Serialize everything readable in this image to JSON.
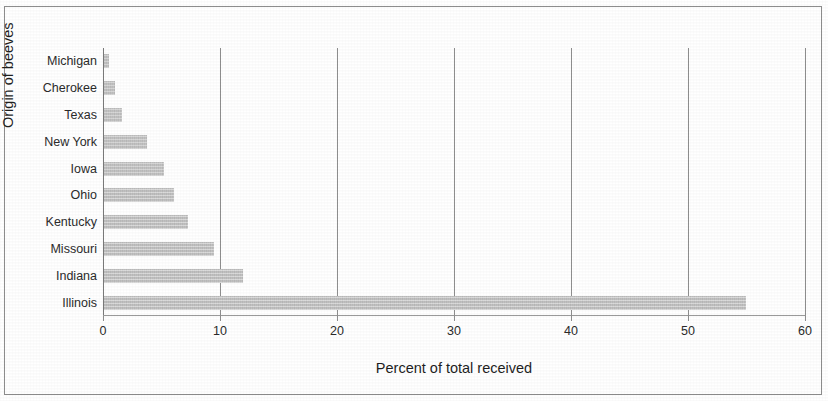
{
  "chart_data": {
    "type": "bar",
    "orientation": "horizontal",
    "title": "",
    "xlabel": "Percent of total received",
    "ylabel": "Origin of beeves",
    "categories": [
      "Illinois",
      "Indiana",
      "Missouri",
      "Kentucky",
      "Ohio",
      "Iowa",
      "New York",
      "Texas",
      "Cherokee",
      "Michigan"
    ],
    "values": [
      54.9,
      11.9,
      9.4,
      7.2,
      6.0,
      5.1,
      3.7,
      1.5,
      0.9,
      0.4
    ],
    "series": [
      {
        "name": "Percent of total received",
        "values": [
          54.9,
          11.9,
          9.4,
          7.2,
          6.0,
          5.1,
          3.7,
          1.5,
          0.9,
          0.4
        ]
      }
    ],
    "display_order_top_to_bottom": [
      "Michigan",
      "Cherokee",
      "Texas",
      "New York",
      "Iowa",
      "Ohio",
      "Kentucky",
      "Missouri",
      "Indiana",
      "Illinois"
    ],
    "xlim": [
      0,
      60
    ],
    "xticks": [
      0,
      10,
      20,
      30,
      40,
      50,
      60
    ],
    "xtick_labels": [
      "0",
      "10",
      "20",
      "30",
      "40",
      "50",
      "60"
    ],
    "grid": "vertical",
    "legend": "none",
    "bar_color": "#c9c9c9",
    "axis_color": "#8e8e8e",
    "text_color": "#2b2b2b"
  },
  "bars": [
    {
      "label": "Michigan",
      "value": 0.4
    },
    {
      "label": "Cherokee",
      "value": 0.9
    },
    {
      "label": "Texas",
      "value": 1.5
    },
    {
      "label": "New York",
      "value": 3.7
    },
    {
      "label": "Iowa",
      "value": 5.1
    },
    {
      "label": "Ohio",
      "value": 6.0
    },
    {
      "label": "Kentucky",
      "value": 7.2
    },
    {
      "label": "Missouri",
      "value": 9.4
    },
    {
      "label": "Indiana",
      "value": 11.9
    },
    {
      "label": "Illinois",
      "value": 54.9
    }
  ],
  "xticks": [
    {
      "label": "0",
      "value": 0
    },
    {
      "label": "10",
      "value": 10
    },
    {
      "label": "20",
      "value": 20
    },
    {
      "label": "30",
      "value": 30
    },
    {
      "label": "40",
      "value": 40
    },
    {
      "label": "50",
      "value": 50
    },
    {
      "label": "60",
      "value": 60
    }
  ],
  "axes": {
    "x_title": "Percent of total received",
    "y_title": "Origin of beeves"
  }
}
